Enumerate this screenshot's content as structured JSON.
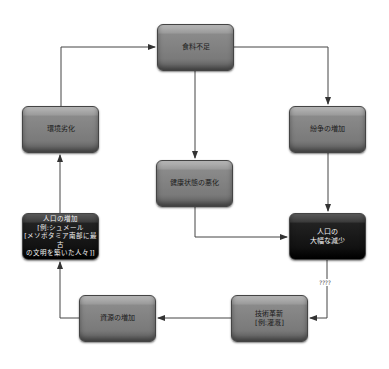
{
  "diagram": {
    "nodes": [
      {
        "id": "food-shortage",
        "label": "食料不足",
        "style": "light"
      },
      {
        "id": "environmental-degradation",
        "label": "環境劣化",
        "style": "light"
      },
      {
        "id": "conflict-increase",
        "label": "紛争の増加",
        "style": "light"
      },
      {
        "id": "health-deterioration",
        "label": "健康状態の悪化",
        "style": "light"
      },
      {
        "id": "population-increase",
        "label": "人口の増加\n[例:シュメール\n[メソポタミア南部に最古\nの文明を築いた人々]]",
        "style": "dark"
      },
      {
        "id": "population-decline",
        "label": "人口の\n大幅な減少",
        "style": "dark"
      },
      {
        "id": "resource-increase",
        "label": "資源の増加",
        "style": "light"
      },
      {
        "id": "technical-innovation",
        "label": "技術革新\n[例:灌漑]",
        "style": "light"
      }
    ],
    "edges": [
      {
        "from": "environmental-degradation",
        "to": "food-shortage"
      },
      {
        "from": "food-shortage",
        "to": "conflict-increase"
      },
      {
        "from": "food-shortage",
        "to": "health-deterioration"
      },
      {
        "from": "conflict-increase",
        "to": "population-decline"
      },
      {
        "from": "health-deterioration",
        "to": "population-decline"
      },
      {
        "from": "population-decline",
        "to": "technical-innovation",
        "label": "????"
      },
      {
        "from": "technical-innovation",
        "to": "resource-increase"
      },
      {
        "from": "resource-increase",
        "to": "population-increase"
      },
      {
        "from": "population-increase",
        "to": "environmental-degradation"
      }
    ],
    "unknown_edge_label": "????"
  }
}
